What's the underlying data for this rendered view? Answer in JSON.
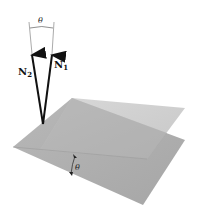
{
  "figure": {
    "normals": [
      {
        "name": "N1",
        "base": "N",
        "subscript": "1"
      },
      {
        "name": "N2",
        "base": "N",
        "subscript": "2"
      }
    ],
    "angle_label_top": "θ",
    "angle_label_planes": "θ",
    "colors": {
      "plane_light": "#c9c9c9",
      "plane_mid": "#b3b3b3",
      "plane_dark": "#9c9c9c",
      "vector": "#111111",
      "background": "#ffffff"
    }
  }
}
